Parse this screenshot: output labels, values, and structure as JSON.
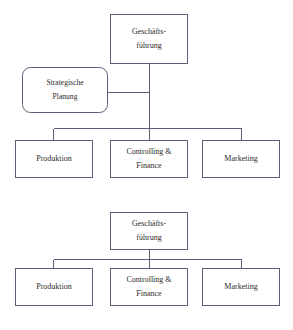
{
  "diagram": {
    "type": "organizational-chart",
    "background_color": "#ffffff",
    "line_color": "#5a6079",
    "text_color": "#2b2b2b",
    "box_fill": "#ffffff",
    "charts": [
      {
        "id": "chart-with-staff-unit",
        "description": "Stabliniensystem mit Stabsstelle",
        "top": {
          "label_line1": "Geschäfts-",
          "label_line2": "führung",
          "shape": "rectangle"
        },
        "staff": {
          "label_line1": "Strategische",
          "label_line2": "Planung",
          "shape": "rounded-rectangle"
        },
        "children": [
          {
            "label_line1": "Produktion",
            "label_line2": ""
          },
          {
            "label_line1": "Controlling &",
            "label_line2": "Finance"
          },
          {
            "label_line1": "Marketing",
            "label_line2": ""
          }
        ]
      },
      {
        "id": "chart-line-organization",
        "description": "Einliniensystem ohne Stabsstelle",
        "top": {
          "label_line1": "Geschäfts-",
          "label_line2": "führung",
          "shape": "rectangle"
        },
        "staff": null,
        "children": [
          {
            "label_line1": "Produktion",
            "label_line2": ""
          },
          {
            "label_line1": "Controlling &",
            "label_line2": "Finance"
          },
          {
            "label_line1": "Marketing",
            "label_line2": ""
          }
        ]
      }
    ]
  }
}
